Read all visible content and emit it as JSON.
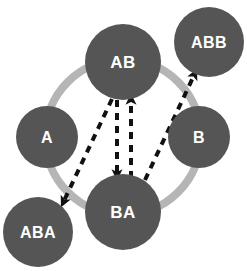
{
  "diagram": {
    "background_color": "#ffffff",
    "ring": {
      "name": "cycle-ring",
      "color": "#b5b5b5",
      "center_x": 123,
      "center_y": 137,
      "radius": 78,
      "stroke_width": 8
    },
    "node_style": {
      "fill": "#555555",
      "label_color": "#ffffff"
    },
    "edge_style": {
      "color": "#111111",
      "stroke_width": 4,
      "dash_pattern": "7,6",
      "style": "dashed"
    },
    "nodes": [
      {
        "id": "AB",
        "label": "AB",
        "x": 123,
        "y": 62,
        "r": 38,
        "font_size": 17,
        "on_ring": true,
        "position": "top"
      },
      {
        "id": "ABB",
        "label": "ABB",
        "x": 209,
        "y": 42,
        "r": 35,
        "font_size": 16,
        "on_ring": false,
        "position": "top-right"
      },
      {
        "id": "A",
        "label": "A",
        "x": 47,
        "y": 137,
        "r": 31,
        "font_size": 16,
        "on_ring": true,
        "position": "left"
      },
      {
        "id": "B",
        "label": "B",
        "x": 199,
        "y": 137,
        "r": 31,
        "font_size": 16,
        "on_ring": true,
        "position": "right"
      },
      {
        "id": "ABA",
        "label": "ABA",
        "x": 38,
        "y": 232,
        "r": 35,
        "font_size": 16,
        "on_ring": false,
        "position": "bottom-left"
      },
      {
        "id": "BA",
        "label": "BA",
        "x": 123,
        "y": 212,
        "r": 38,
        "font_size": 17,
        "on_ring": true,
        "position": "bottom"
      }
    ],
    "edges": [
      {
        "id": "ab-to-aba",
        "from": "AB",
        "to": "ABA",
        "x1": 112,
        "y1": 99,
        "x2": 62,
        "y2": 205,
        "arrowhead": "end",
        "direction": "down-left"
      },
      {
        "id": "ab-to-ba",
        "from": "AB",
        "to": "BA",
        "x1": 117,
        "y1": 100,
        "x2": 117,
        "y2": 178,
        "arrowhead": "end",
        "direction": "down"
      },
      {
        "id": "ba-to-ab",
        "from": "BA",
        "to": "AB",
        "x1": 131,
        "y1": 178,
        "x2": 131,
        "y2": 96,
        "arrowhead": "end",
        "direction": "up"
      },
      {
        "id": "ba-to-abb",
        "from": "BA",
        "to": "ABB",
        "x1": 145,
        "y1": 180,
        "x2": 196,
        "y2": 71,
        "arrowhead": "end",
        "direction": "up-right"
      }
    ]
  }
}
